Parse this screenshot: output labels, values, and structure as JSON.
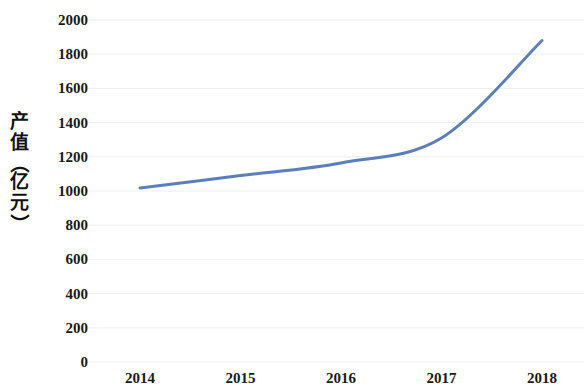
{
  "chart_data": {
    "type": "line",
    "title": "",
    "xlabel": "",
    "ylabel": "产值（亿元）",
    "categories": [
      "2014",
      "2015",
      "2016",
      "2017",
      "2018"
    ],
    "series": [
      {
        "name": "产值",
        "values": [
          1018,
          1090,
          1164,
          1310,
          1880
        ],
        "color": "#5B7FB8"
      }
    ],
    "ylim": [
      0,
      2000
    ],
    "ytick_step": 200,
    "ytick_labels": [
      "0",
      "200",
      "400",
      "600",
      "800",
      "1000",
      "1200",
      "1400",
      "1600",
      "1800",
      "2000"
    ],
    "grid": {
      "horizontal": true,
      "vertical": false,
      "color": "#EFEFEF"
    },
    "legend": {
      "visible": false,
      "position": "none"
    },
    "axis_line": {
      "visible": false
    },
    "markers": false,
    "smoothing": true,
    "line_width": 3
  },
  "y_axis_title_chars": [
    "产",
    "值",
    "（",
    "亿",
    "元",
    "）"
  ]
}
